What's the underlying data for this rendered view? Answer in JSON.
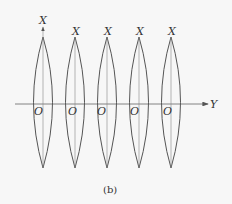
{
  "diagram": {
    "caption": "(b)",
    "axis_y_label": "Y",
    "axis_x_label": "X",
    "origin_label": "O",
    "lens_count": 5,
    "colors": {
      "stroke": "#555555",
      "axis": "#666666",
      "background": "#f7f7f7"
    },
    "lenses": [
      {
        "x_label": "X",
        "origin_label": "O",
        "center_x": 43
      },
      {
        "x_label": "X",
        "origin_label": "O",
        "center_x": 75
      },
      {
        "x_label": "X",
        "origin_label": "O",
        "center_x": 107
      },
      {
        "x_label": "X",
        "origin_label": "O",
        "center_x": 139
      },
      {
        "x_label": "X",
        "origin_label": "O",
        "center_x": 171
      }
    ]
  }
}
